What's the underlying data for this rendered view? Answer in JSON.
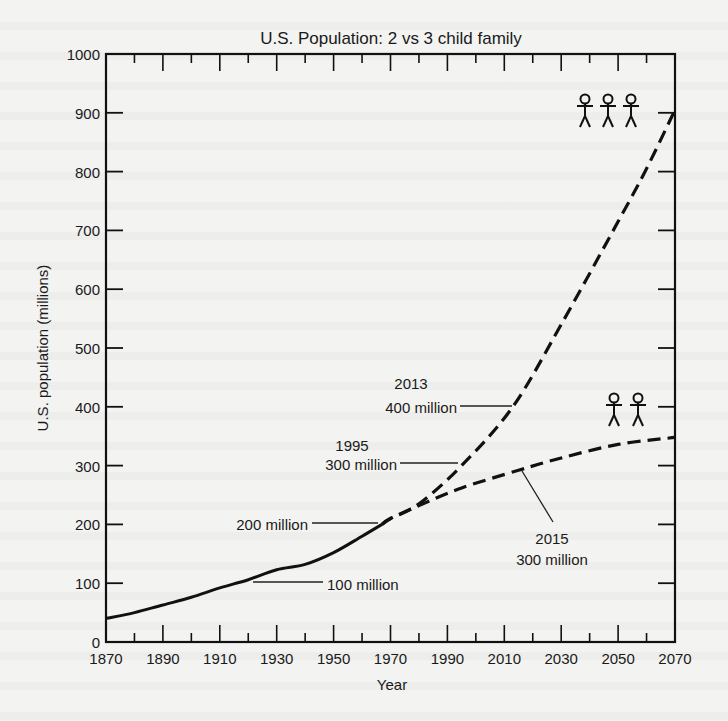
{
  "chart_data": {
    "type": "line",
    "title": "U.S. Population: 2 vs 3 child family",
    "xlabel": "Year",
    "ylabel": "U.S. population (millions)",
    "xlim": [
      1870,
      2070
    ],
    "ylim": [
      0,
      1000
    ],
    "x_ticks": [
      1870,
      1890,
      1910,
      1930,
      1950,
      1970,
      1990,
      2010,
      2030,
      2050,
      2070
    ],
    "y_ticks": [
      0,
      100,
      200,
      300,
      400,
      500,
      600,
      700,
      800,
      900,
      1000
    ],
    "grid": false,
    "series": [
      {
        "name": "Historical",
        "style": "solid",
        "x": [
          1870,
          1880,
          1890,
          1900,
          1910,
          1920,
          1930,
          1940,
          1950,
          1960,
          1967
        ],
        "values": [
          40,
          50,
          63,
          76,
          92,
          106,
          123,
          132,
          152,
          180,
          200
        ]
      },
      {
        "name": "3 child family",
        "style": "dashed",
        "x": [
          1967,
          1970,
          1980,
          1995,
          2013,
          2030,
          2050,
          2060,
          2070
        ],
        "values": [
          200,
          210,
          235,
          300,
          400,
          540,
          715,
          805,
          905
        ]
      },
      {
        "name": "2 child family",
        "style": "dashed",
        "x": [
          1967,
          1970,
          1980,
          1995,
          2015,
          2030,
          2050,
          2070
        ],
        "values": [
          200,
          210,
          232,
          262,
          292,
          313,
          336,
          348
        ]
      }
    ],
    "annotations": [
      {
        "id": "ann100",
        "lines": [
          "100 million"
        ],
        "x": 1930,
        "y": 100
      },
      {
        "id": "ann200",
        "lines": [
          "200 million"
        ],
        "x": 1967,
        "y": 200
      },
      {
        "id": "ann1995",
        "lines": [
          "1995",
          "300 million"
        ],
        "x": 1995,
        "y": 300
      },
      {
        "id": "ann2013",
        "lines": [
          "2013",
          "400 million"
        ],
        "x": 2013,
        "y": 400
      },
      {
        "id": "ann2015",
        "lines": [
          "2015",
          "300 million"
        ],
        "x": 2015,
        "y": 292
      }
    ],
    "legend_icons": [
      {
        "name": "3 child family",
        "figures": 3
      },
      {
        "name": "2 child family",
        "figures": 2
      }
    ]
  }
}
